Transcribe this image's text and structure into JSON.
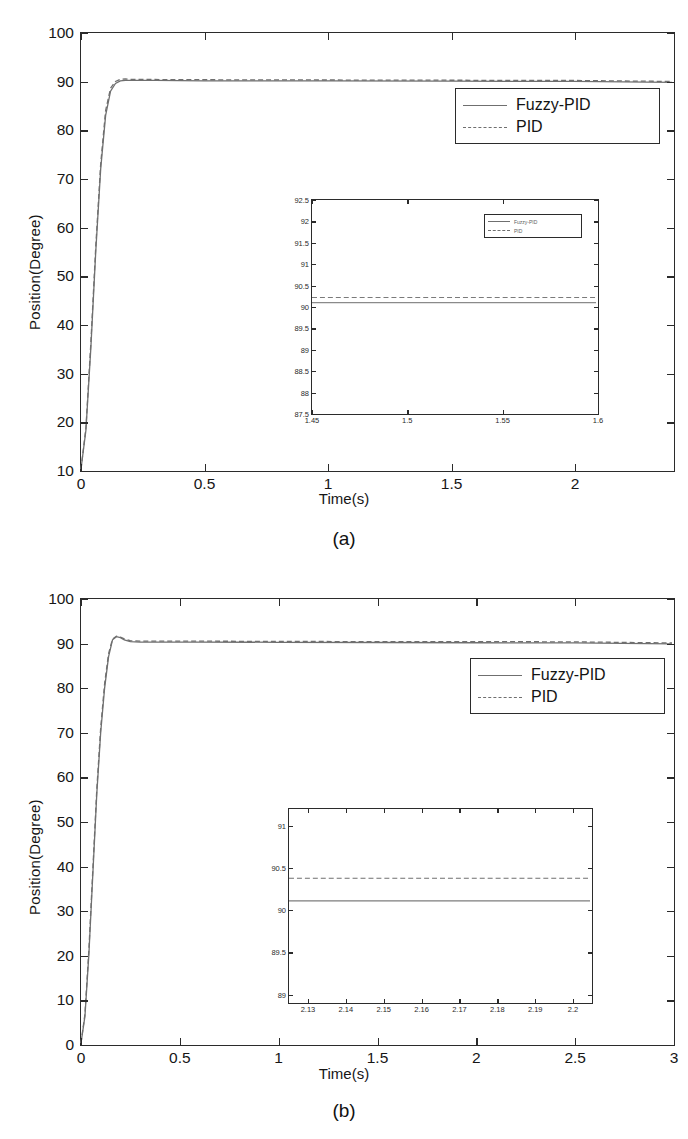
{
  "chart_data": [
    {
      "id": "panel-a",
      "type": "line",
      "caption": "(a)",
      "title": "",
      "xlabel": "Time(s)",
      "ylabel": "Position(Degree)",
      "xlim": [
        0,
        2.4
      ],
      "ylim": [
        10,
        100
      ],
      "xticks": [
        "0",
        "0.5",
        "1",
        "1.5",
        "2"
      ],
      "xtick_values": [
        0,
        0.5,
        1,
        1.5,
        2
      ],
      "yticks": [
        "10",
        "20",
        "30",
        "40",
        "50",
        "60",
        "70",
        "80",
        "90",
        "100"
      ],
      "ytick_values": [
        10,
        20,
        30,
        40,
        50,
        60,
        70,
        80,
        90,
        100
      ],
      "grid": false,
      "legend_position": "upper right",
      "series": [
        {
          "name": "Fuzzy-PID",
          "style": "solid",
          "color": "#6f6f6f",
          "x": [
            0,
            0.02,
            0.04,
            0.06,
            0.08,
            0.1,
            0.12,
            0.14,
            0.16,
            0.18,
            0.2,
            0.25,
            0.3,
            0.5,
            1.0,
            1.5,
            2.0,
            2.4
          ],
          "y": [
            10,
            18,
            35,
            55,
            72,
            83,
            88,
            89.6,
            90.1,
            90.2,
            90.2,
            90.2,
            90.2,
            90.1,
            90.1,
            90.05,
            90.0,
            89.8
          ]
        },
        {
          "name": "PID",
          "style": "dashed",
          "color": "#6f6f6f",
          "x": [
            0,
            0.02,
            0.04,
            0.06,
            0.08,
            0.1,
            0.12,
            0.14,
            0.16,
            0.18,
            0.2,
            0.25,
            0.3,
            0.5,
            1.0,
            1.5,
            2.0,
            2.4
          ],
          "y": [
            10,
            18.5,
            36,
            56,
            73,
            84,
            88.6,
            90.0,
            90.45,
            90.5,
            90.45,
            90.4,
            90.4,
            90.35,
            90.3,
            90.25,
            90.2,
            90.0
          ]
        }
      ],
      "inset": {
        "xlim": [
          1.45,
          1.6
        ],
        "ylim": [
          87.5,
          92.5
        ],
        "xticks": [
          "1.45",
          "1.5",
          "1.55",
          "1.6"
        ],
        "xtick_values": [
          1.45,
          1.5,
          1.55,
          1.6
        ],
        "yticks": [
          "92.5",
          "92",
          "91.5",
          "91",
          "90.5",
          "90",
          "89.5",
          "89",
          "88.5",
          "88",
          "87.5"
        ],
        "ytick_values": [
          92.5,
          92,
          91.5,
          91,
          90.5,
          90,
          89.5,
          89,
          88.5,
          88,
          87.5
        ],
        "legend_position": "upper right",
        "series": [
          {
            "name": "Fuzzy-PID",
            "style": "solid",
            "color": "#8a8a8a",
            "value": 90.08
          },
          {
            "name": "PID",
            "style": "dashed",
            "color": "#7a7a7a",
            "value": 90.2
          }
        ]
      }
    },
    {
      "id": "panel-b",
      "type": "line",
      "caption": "(b)",
      "title": "",
      "xlabel": "Time(s)",
      "ylabel": "Position(Degree)",
      "xlim": [
        0,
        3
      ],
      "ylim": [
        0,
        100
      ],
      "xticks": [
        "0",
        "0.5",
        "1",
        "1.5",
        "2",
        "2.5",
        "3"
      ],
      "xtick_values": [
        0,
        0.5,
        1,
        1.5,
        2,
        2.5,
        3
      ],
      "yticks": [
        "0",
        "10",
        "20",
        "30",
        "40",
        "50",
        "60",
        "70",
        "80",
        "90",
        "100"
      ],
      "ytick_values": [
        0,
        10,
        20,
        30,
        40,
        50,
        60,
        70,
        80,
        90,
        100
      ],
      "grid": false,
      "legend_position": "upper right",
      "series": [
        {
          "name": "Fuzzy-PID",
          "style": "solid",
          "color": "#6f6f6f",
          "x": [
            0,
            0.02,
            0.04,
            0.06,
            0.08,
            0.1,
            0.12,
            0.14,
            0.16,
            0.18,
            0.2,
            0.22,
            0.25,
            0.3,
            0.4,
            0.6,
            1.0,
            1.5,
            2.0,
            2.5,
            3.0
          ],
          "y": [
            0,
            6,
            20,
            38,
            56,
            70,
            80,
            87,
            90.8,
            91.5,
            91.3,
            90.8,
            90.4,
            90.3,
            90.3,
            90.3,
            90.25,
            90.2,
            90.15,
            90.1,
            89.9
          ]
        },
        {
          "name": "PID",
          "style": "dashed",
          "color": "#6f6f6f",
          "x": [
            0,
            0.02,
            0.04,
            0.06,
            0.08,
            0.1,
            0.12,
            0.14,
            0.16,
            0.18,
            0.2,
            0.22,
            0.25,
            0.3,
            0.4,
            0.6,
            1.0,
            1.5,
            2.0,
            2.5,
            3.0
          ],
          "y": [
            0,
            6.5,
            21,
            39,
            57,
            71,
            81,
            87.7,
            91.0,
            91.6,
            91.4,
            91.0,
            90.6,
            90.5,
            90.5,
            90.5,
            90.45,
            90.4,
            90.4,
            90.35,
            90.1
          ]
        }
      ],
      "inset": {
        "xlim": [
          2.125,
          2.205
        ],
        "ylim": [
          88.9,
          91.2
        ],
        "xticks": [
          "2.13",
          "2.14",
          "2.15",
          "2.16",
          "2.17",
          "2.18",
          "2.19",
          "2.2"
        ],
        "xtick_values": [
          2.13,
          2.14,
          2.15,
          2.16,
          2.17,
          2.18,
          2.19,
          2.2
        ],
        "yticks": [
          "91",
          "90.5",
          "90",
          "89.5",
          "89"
        ],
        "ytick_values": [
          91,
          90.5,
          90,
          89.5,
          89
        ],
        "legend_position": "none",
        "series": [
          {
            "name": "Fuzzy-PID",
            "style": "solid",
            "color": "#7d7d7d",
            "value": 90.1
          },
          {
            "name": "PID",
            "style": "dashed",
            "color": "#6f6f6f",
            "value": 90.37
          }
        ]
      }
    }
  ],
  "legend": {
    "fuzzy_label": "Fuzzy-PID",
    "pid_label": "PID"
  }
}
